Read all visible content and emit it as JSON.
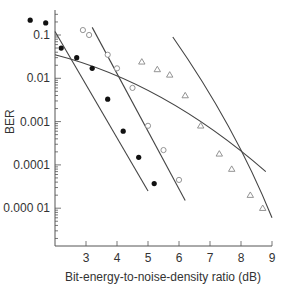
{
  "chart_data": {
    "type": "scatter",
    "title": "",
    "xlabel": "Bit-energy-to-noise-density ratio (dB)",
    "ylabel": "BER",
    "xlim": [
      2,
      9
    ],
    "ylim": [
      3e-06,
      0.3
    ],
    "yscale": "log",
    "grid": false,
    "legend": "none",
    "x_ticks": [
      "3",
      "4",
      "5",
      "6",
      "7",
      "8",
      "9"
    ],
    "y_ticks": [
      "0.1",
      "0.01",
      "0.001",
      "0.0001",
      "0.000 01"
    ],
    "series": [
      {
        "name": "filled circles",
        "marker": "filled-circle",
        "points": [
          [
            1.2,
            0.22
          ],
          [
            1.7,
            0.19
          ],
          [
            2.2,
            0.05
          ],
          [
            2.7,
            0.03
          ],
          [
            3.2,
            0.017
          ],
          [
            3.7,
            0.0033
          ],
          [
            4.2,
            0.0006
          ],
          [
            4.7,
            0.00015
          ],
          [
            5.2,
            3.7e-05
          ]
        ]
      },
      {
        "name": "open circles",
        "marker": "open-circle",
        "points": [
          [
            2.9,
            0.13
          ],
          [
            3.1,
            0.1
          ],
          [
            3.7,
            0.035
          ],
          [
            4.0,
            0.017
          ],
          [
            4.5,
            0.006
          ],
          [
            5.0,
            0.0008
          ],
          [
            5.5,
            0.00022
          ],
          [
            6.0,
            4.5e-05
          ]
        ]
      },
      {
        "name": "open triangles",
        "marker": "open-triangle",
        "points": [
          [
            4.8,
            0.024
          ],
          [
            5.3,
            0.016
          ],
          [
            5.7,
            0.012
          ],
          [
            6.2,
            0.004
          ],
          [
            6.7,
            0.0008
          ],
          [
            7.3,
            0.00018
          ],
          [
            7.7,
            8e-05
          ],
          [
            8.3,
            2e-05
          ],
          [
            8.7,
            1e-05
          ]
        ]
      }
    ],
    "curves": [
      {
        "name": "fit line 1 (steep, left)",
        "from": [
          2.0,
          0.12
        ],
        "to": [
          5.0,
          2.5e-05
        ]
      },
      {
        "name": "fit line 2 (shallow)",
        "from": [
          2.0,
          0.035
        ],
        "to": [
          8.8,
          7e-05
        ]
      },
      {
        "name": "fit line 3",
        "from": [
          3.2,
          0.15
        ],
        "to": [
          6.2,
          1.5e-05
        ]
      },
      {
        "name": "fit line 4 (right)",
        "from": [
          5.8,
          0.09
        ],
        "to": [
          9.0,
          6e-06
        ]
      }
    ]
  }
}
